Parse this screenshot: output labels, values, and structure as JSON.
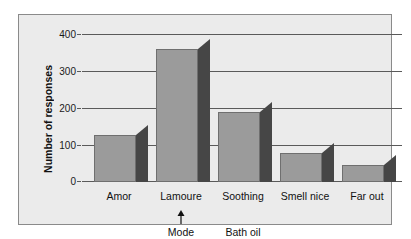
{
  "chart_data": {
    "type": "bar",
    "title": "",
    "xlabel": "",
    "ylabel": "Number of responses",
    "categories": [
      "Amor",
      "Lamoure",
      "Soothing",
      "Smell nice",
      "Far out"
    ],
    "values": [
      128,
      360,
      188,
      79,
      45
    ],
    "ylim": [
      0,
      400
    ],
    "yticks": [
      0,
      100,
      200,
      300,
      400
    ],
    "ytick_labels": [
      "0",
      "100",
      "200",
      "300",
      "400"
    ],
    "grid": true,
    "legend": null,
    "series": [
      {
        "name": "Number of responses",
        "values": [
          128,
          360,
          188,
          79,
          45
        ]
      }
    ],
    "annotations": [
      {
        "text": "Mode",
        "points_to": "Lamoure",
        "arrow": "up"
      },
      {
        "text": "Bath oil",
        "points_to": null,
        "arrow": null
      }
    ],
    "colors": {
      "bar_front": "#9b9b9b",
      "bar_side": "#464646",
      "bar_edge": "#6f6f6f",
      "panel_background": "#ebebeb",
      "panel_border": "#8a8a8a",
      "gridline": "#5a5a5a",
      "text": "#111111",
      "page_background": "#ffffff"
    }
  }
}
